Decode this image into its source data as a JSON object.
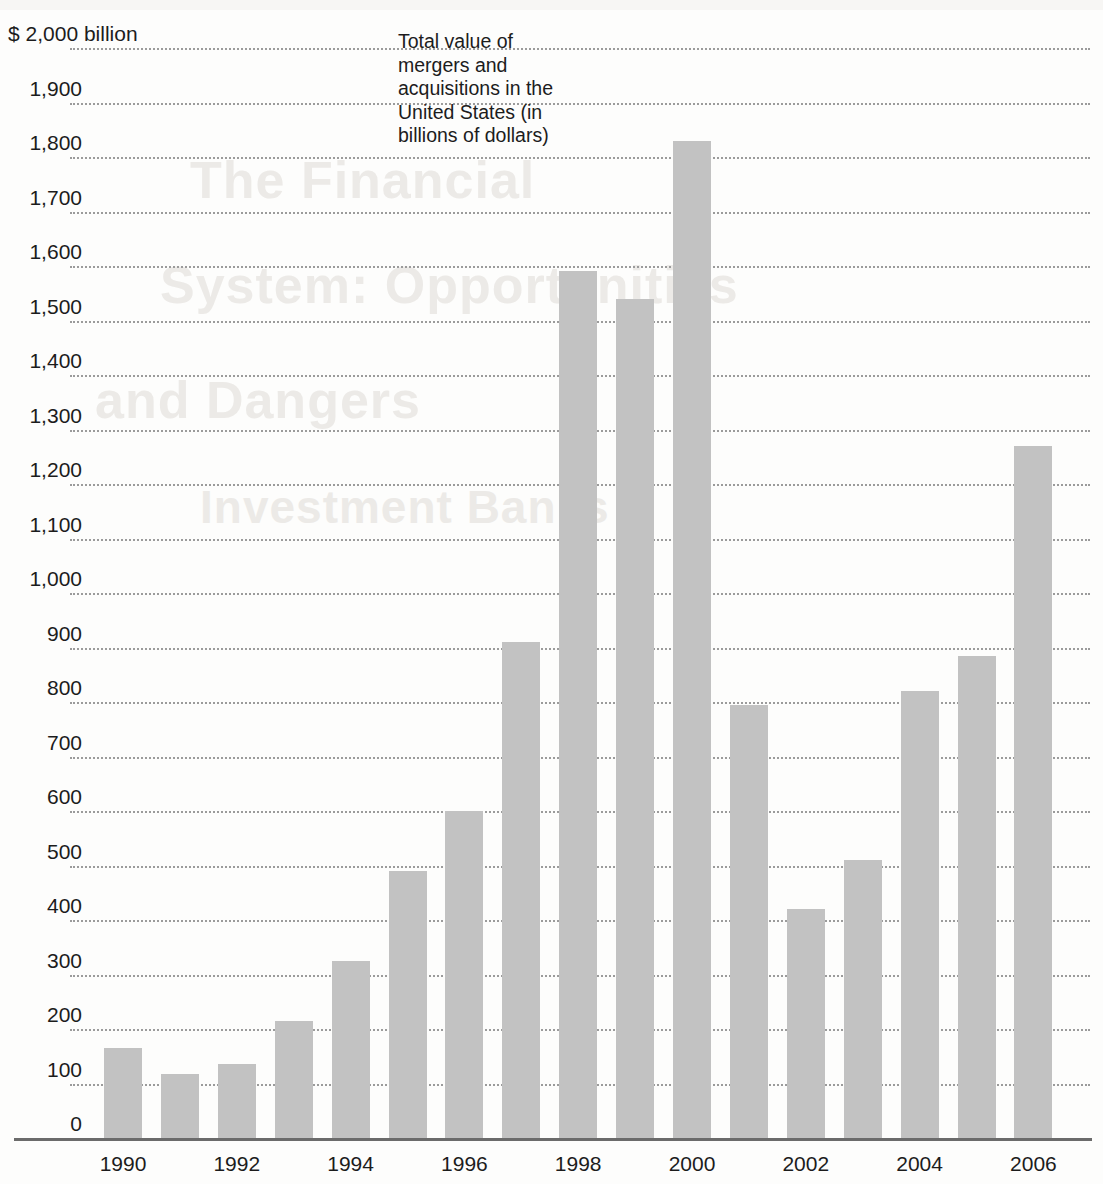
{
  "chart_data": {
    "type": "bar",
    "title": "Total value of mergers and acquisitions in the United States (in billions of dollars)",
    "xlabel": "",
    "ylabel": "$ 2,000 billion",
    "ylim": [
      0,
      2000
    ],
    "grid": true,
    "legend": "none",
    "units": "billions of dollars",
    "categories": [
      "1990",
      "1991",
      "1992",
      "1993",
      "1994",
      "1995",
      "1996",
      "1997",
      "1998",
      "1999",
      "2000",
      "2001",
      "2002",
      "2003",
      "2004",
      "2005",
      "2006"
    ],
    "values": [
      165,
      117,
      135,
      215,
      325,
      490,
      600,
      910,
      1590,
      1540,
      1830,
      795,
      420,
      510,
      820,
      885,
      1270
    ],
    "x_tick_labels": [
      "1990",
      "1992",
      "1994",
      "1996",
      "1998",
      "2000",
      "2002",
      "2004",
      "2006"
    ],
    "y_tick_labels": [
      "$ 2,000 billion",
      "1,900",
      "1,800",
      "1,700",
      "1,600",
      "1,500",
      "1,400",
      "1,300",
      "1,200",
      "1,100",
      "1,000",
      "900",
      "800",
      "700",
      "600",
      "500",
      "400",
      "300",
      "200",
      "100",
      "0"
    ],
    "y_tick_values": [
      2000,
      1900,
      1800,
      1700,
      1600,
      1500,
      1400,
      1300,
      1200,
      1100,
      1000,
      900,
      800,
      700,
      600,
      500,
      400,
      300,
      200,
      100,
      0
    ],
    "bar_color": "#c2c2c2",
    "gridline_color": "#9b9b9b",
    "axis_color": "#6b6b6b",
    "text_color": "#1c1c1c"
  },
  "caption": {
    "text": "Total value of mergers and acquisitions in the United States (in billions of dollars)"
  },
  "ghost_text": {
    "line1": "The Financial",
    "line2": "System: Opportunities",
    "line3": "and Dangers",
    "line4": "Investment Banks"
  }
}
